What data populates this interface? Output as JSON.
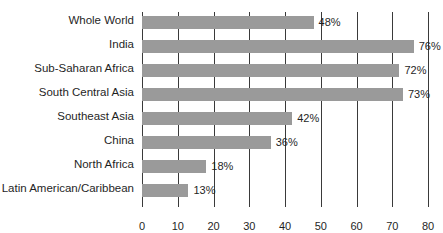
{
  "chart_data": {
    "type": "bar",
    "orientation": "horizontal",
    "title": "",
    "subtitle": "",
    "xlabel": "",
    "ylabel": "",
    "categories": [
      "Whole World",
      "India",
      "Sub-Saharan Africa",
      "South Central Asia",
      "Southeast Asia",
      "China",
      "North Africa",
      "Latin American/Caribbean"
    ],
    "values": [
      48,
      76,
      72,
      73,
      42,
      36,
      18,
      13
    ],
    "data_labels": [
      "48%",
      "76%",
      "72%",
      "73%",
      "42%",
      "36%",
      "18%",
      "13%"
    ],
    "xlim": [
      0,
      80
    ],
    "xticks": [
      0,
      10,
      20,
      30,
      40,
      50,
      60,
      70,
      80
    ],
    "xtick_labels": [
      "0",
      "10",
      "20",
      "30",
      "40",
      "50",
      "60",
      "70",
      "80"
    ],
    "grid": true,
    "grid_axis": "x",
    "legend": false,
    "legend_position": "none",
    "bar_color": "#9a9a9a",
    "gridline_color": "#3a3a3a",
    "text_color": "#1f1f1f",
    "background_color": "#ffffff"
  }
}
